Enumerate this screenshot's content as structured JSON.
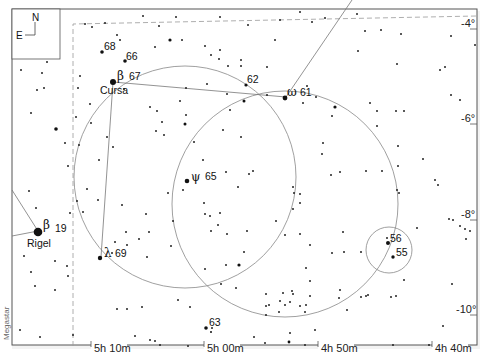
{
  "chart": {
    "software_credit": "Megastar",
    "compass": {
      "north": "N",
      "east": "E"
    },
    "ra_labels": [
      "5h 10m",
      "5h 00m",
      "4h 50m",
      "4h 40m"
    ],
    "dec_labels": [
      "-4°",
      "-6°",
      "-8°",
      "-10°"
    ],
    "named_stars": [
      {
        "greek": "β",
        "flamsteed": "19",
        "name": "Rigel"
      },
      {
        "greek": "β",
        "flamsteed": "67",
        "name": "Cursa"
      },
      {
        "greek": "ψ",
        "flamsteed": "65",
        "name": ""
      },
      {
        "greek": "λ",
        "flamsteed": "69",
        "name": ""
      },
      {
        "greek": "ω",
        "flamsteed": "61",
        "name": ""
      }
    ],
    "numbered_stars": [
      "68",
      "66",
      "62",
      "56",
      "55",
      "63"
    ],
    "colors": {
      "background": "#ffffff",
      "ink": "#111111",
      "lines": "#777777",
      "frame": "#555555"
    }
  }
}
